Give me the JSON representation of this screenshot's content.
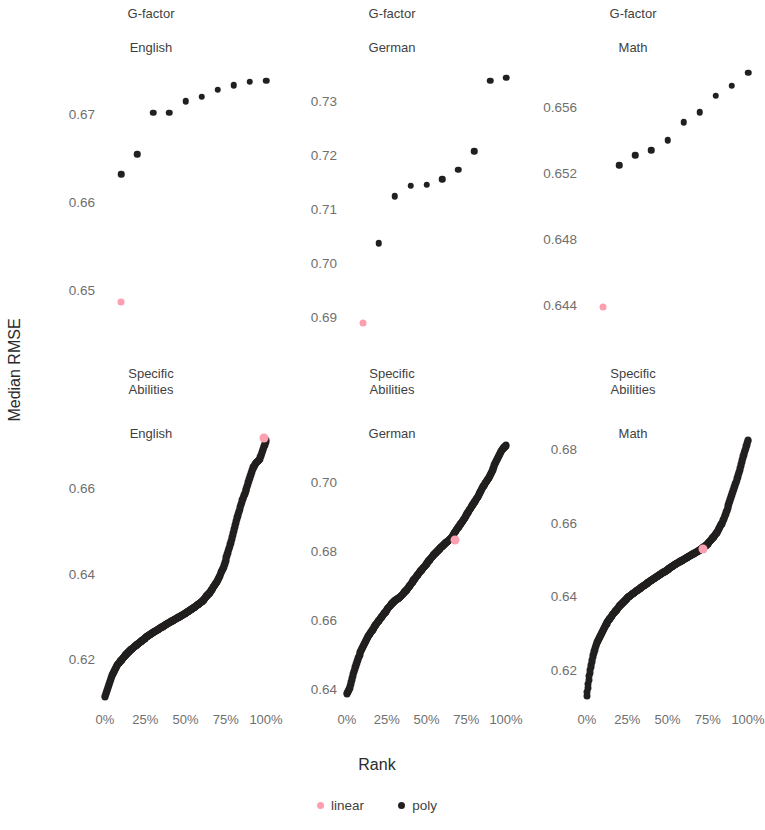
{
  "axes": {
    "y_title": "Median RMSE",
    "x_title": "Rank"
  },
  "legend": {
    "items": [
      {
        "label": "linear",
        "color": "#fb9fb1"
      },
      {
        "label": "poly",
        "color": "#221f1f"
      }
    ]
  },
  "panels": [
    {
      "id": "gfactor-english",
      "strip_top": "G-factor",
      "strip_bottom": "English",
      "yticks": [
        "0.67",
        "0.66",
        "0.65"
      ]
    },
    {
      "id": "gfactor-german",
      "strip_top": "G-factor",
      "strip_bottom": "German",
      "yticks": [
        "0.73",
        "0.72",
        "0.71",
        "0.70",
        "0.69"
      ]
    },
    {
      "id": "gfactor-math",
      "strip_top": "G-factor",
      "strip_bottom": "Math",
      "yticks": [
        "0.656",
        "0.652",
        "0.648",
        "0.644"
      ]
    },
    {
      "id": "specific-english",
      "strip_top": "Specific\nAbilities",
      "strip_bottom": "English",
      "yticks": [
        "0.66",
        "0.64",
        "0.62"
      ]
    },
    {
      "id": "specific-german",
      "strip_top": "Specific\nAbilities",
      "strip_bottom": "German",
      "yticks": [
        "0.70",
        "0.68",
        "0.66",
        "0.64"
      ]
    },
    {
      "id": "specific-math",
      "strip_top": "Specific\nAbilities",
      "strip_bottom": "Math",
      "yticks": [
        "0.68",
        "0.66",
        "0.64",
        "0.62"
      ]
    }
  ],
  "xticks": [
    "0%",
    "25%",
    "50%",
    "75%",
    "100%"
  ],
  "chart_data": {
    "type": "scatter",
    "title": "",
    "xlabel": "Rank",
    "ylabel": "Median RMSE",
    "layout": {
      "rows": 2,
      "cols": 3,
      "grid": false,
      "legend_position": "bottom"
    },
    "facet_rows": [
      "G-factor",
      "Specific Abilities"
    ],
    "facet_cols": [
      "English",
      "German",
      "Math"
    ],
    "x_ticks_percent": [
      0,
      25,
      50,
      75,
      100
    ],
    "series_names": [
      "linear",
      "poly"
    ],
    "series_colors": {
      "linear": "#fb9fb1",
      "poly": "#221f1f"
    },
    "panels": [
      {
        "facet": "G-factor / English",
        "ylim": [
          0.6455,
          0.6755
        ],
        "yticks": [
          0.67,
          0.66,
          0.65
        ],
        "poly": {
          "x": [
            10,
            20,
            30,
            40,
            50,
            60,
            70,
            80,
            90,
            100
          ],
          "y": [
            0.6632,
            0.6655,
            0.6702,
            0.6702,
            0.6715,
            0.672,
            0.6728,
            0.6733,
            0.6737,
            0.6738
          ]
        },
        "linear": {
          "x": [
            10
          ],
          "y": [
            0.6487
          ]
        }
      },
      {
        "facet": "G-factor / German",
        "ylim": [
          0.6875,
          0.7365
        ],
        "yticks": [
          0.73,
          0.72,
          0.71,
          0.7,
          0.69
        ],
        "poly": {
          "x": [
            20,
            30,
            40,
            50,
            60,
            70,
            80,
            90,
            100
          ],
          "y": [
            0.7036,
            0.7123,
            0.7143,
            0.7145,
            0.7155,
            0.7172,
            0.7207,
            0.7338,
            0.7343
          ]
        },
        "linear": {
          "x": [
            10
          ],
          "y": [
            0.6888
          ]
        }
      },
      {
        "facet": "G-factor / Math",
        "ylim": [
          0.6425,
          0.6585
        ],
        "yticks": [
          0.656,
          0.652,
          0.648,
          0.644
        ],
        "poly": {
          "x": [
            20,
            30,
            40,
            50,
            60,
            70,
            80,
            90,
            100
          ],
          "y": [
            0.6525,
            0.6531,
            0.6534,
            0.654,
            0.6551,
            0.6557,
            0.6567,
            0.6573,
            0.6581
          ]
        },
        "linear": {
          "x": [
            10
          ],
          "y": [
            0.6439
          ]
        }
      },
      {
        "facet": "Specific Abilities / English",
        "ylim": [
          0.6105,
          0.6722
        ],
        "yticks": [
          0.66,
          0.64,
          0.62
        ],
        "poly_curve_description": "dense monotone increasing curve of ~hundreds of points from (0%,0.6112) rising steeply to (~20%,0.6205), slowly through (50%,0.6283) and (75%,0.6375), then steeply to (100%,0.6712)",
        "poly_curve": [
          [
            0,
            0.6112
          ],
          [
            2,
            0.6135
          ],
          [
            4,
            0.6158
          ],
          [
            6,
            0.6175
          ],
          [
            8,
            0.6189
          ],
          [
            12,
            0.6207
          ],
          [
            16,
            0.6222
          ],
          [
            20,
            0.6235
          ],
          [
            25,
            0.625
          ],
          [
            30,
            0.6263
          ],
          [
            35,
            0.6275
          ],
          [
            40,
            0.6286
          ],
          [
            45,
            0.6297
          ],
          [
            50,
            0.6308
          ],
          [
            55,
            0.632
          ],
          [
            60,
            0.6335
          ],
          [
            65,
            0.6355
          ],
          [
            70,
            0.6385
          ],
          [
            74,
            0.642
          ],
          [
            78,
            0.647
          ],
          [
            82,
            0.653
          ],
          [
            85,
            0.657
          ],
          [
            88,
            0.66
          ],
          [
            90,
            0.6625
          ],
          [
            92,
            0.6648
          ],
          [
            94,
            0.666
          ],
          [
            96,
            0.6668
          ],
          [
            98,
            0.669
          ],
          [
            100,
            0.6712
          ]
        ],
        "linear": {
          "x": [
            99
          ],
          "y": [
            0.6717
          ]
        }
      },
      {
        "facet": "Specific Abilities / German",
        "ylim": [
          0.6368,
          0.7132
        ],
        "yticks": [
          0.7,
          0.68,
          0.66,
          0.64
        ],
        "poly_curve_description": "dense monotone increasing curve from (0%,0.6385) rising steeply then near-linearly to (100%,0.7105)",
        "poly_curve": [
          [
            0,
            0.6385
          ],
          [
            2,
            0.6405
          ],
          [
            4,
            0.6445
          ],
          [
            7,
            0.649
          ],
          [
            10,
            0.6522
          ],
          [
            14,
            0.6558
          ],
          [
            18,
            0.6585
          ],
          [
            22,
            0.661
          ],
          [
            26,
            0.6635
          ],
          [
            30,
            0.6655
          ],
          [
            34,
            0.6668
          ],
          [
            38,
            0.669
          ],
          [
            42,
            0.6715
          ],
          [
            46,
            0.674
          ],
          [
            50,
            0.6762
          ],
          [
            54,
            0.6785
          ],
          [
            58,
            0.6805
          ],
          [
            62,
            0.6822
          ],
          [
            66,
            0.684
          ],
          [
            70,
            0.6868
          ],
          [
            74,
            0.6895
          ],
          [
            78,
            0.6925
          ],
          [
            82,
            0.6955
          ],
          [
            86,
            0.6988
          ],
          [
            90,
            0.7018
          ],
          [
            94,
            0.706
          ],
          [
            97,
            0.709
          ],
          [
            100,
            0.7105
          ]
        ],
        "linear": {
          "x": [
            68
          ],
          "y": [
            0.6832
          ]
        }
      },
      {
        "facet": "Specific Abilities / Math",
        "ylim": [
          0.6118,
          0.6835
        ],
        "yticks": [
          0.68,
          0.66,
          0.64,
          0.62
        ],
        "poly_curve_description": "dense sigmoid-shaped increasing curve from (0%,0.6128) rising steeply, flattening through the middle, then steeply to (100%,0.6825)",
        "poly_curve": [
          [
            0,
            0.6128
          ],
          [
            1,
            0.6165
          ],
          [
            2,
            0.6198
          ],
          [
            4,
            0.6242
          ],
          [
            6,
            0.6272
          ],
          [
            9,
            0.63
          ],
          [
            12,
            0.6325
          ],
          [
            16,
            0.635
          ],
          [
            20,
            0.6372
          ],
          [
            25,
            0.6395
          ],
          [
            30,
            0.6412
          ],
          [
            35,
            0.6428
          ],
          [
            40,
            0.6443
          ],
          [
            45,
            0.6458
          ],
          [
            50,
            0.6472
          ],
          [
            55,
            0.6487
          ],
          [
            60,
            0.65
          ],
          [
            65,
            0.6512
          ],
          [
            70,
            0.6525
          ],
          [
            75,
            0.6542
          ],
          [
            80,
            0.6568
          ],
          [
            84,
            0.66
          ],
          [
            87,
            0.6635
          ],
          [
            90,
            0.6675
          ],
          [
            93,
            0.6715
          ],
          [
            95,
            0.6745
          ],
          [
            97,
            0.678
          ],
          [
            99,
            0.681
          ],
          [
            100,
            0.6825
          ]
        ],
        "linear": {
          "x": [
            72
          ],
          "y": [
            0.6527
          ]
        }
      }
    ]
  }
}
